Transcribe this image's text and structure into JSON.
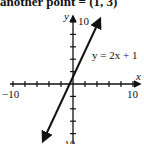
{
  "caption": "another point = (1, 3)",
  "chart_data": {
    "type": "line",
    "title": "",
    "xlabel": "x",
    "ylabel": "y",
    "xlim": [
      -10,
      10
    ],
    "ylim": [
      -10,
      10
    ],
    "x_tick_step": 2,
    "y_tick_step": 2,
    "x_tick_labels": [
      "-10",
      "10"
    ],
    "y_tick_labels": [
      "10",
      "-10"
    ],
    "grid": false,
    "series": [
      {
        "name": "y = 2x + 1",
        "equation": "y = 2x + 1",
        "slope": 2,
        "intercept": 1,
        "x": [
          -5.5,
          4.5
        ],
        "y": [
          -10,
          10
        ],
        "arrows": "both"
      }
    ],
    "annotations": [
      {
        "text": "y = 2x + 1",
        "x": 1.5,
        "y": 6
      }
    ]
  },
  "labels": {
    "x_axis": "x",
    "y_axis": "y",
    "x_min": "−10",
    "x_max": "10",
    "y_max": "10",
    "y_min": "−10",
    "line": "y = 2x + 1"
  }
}
